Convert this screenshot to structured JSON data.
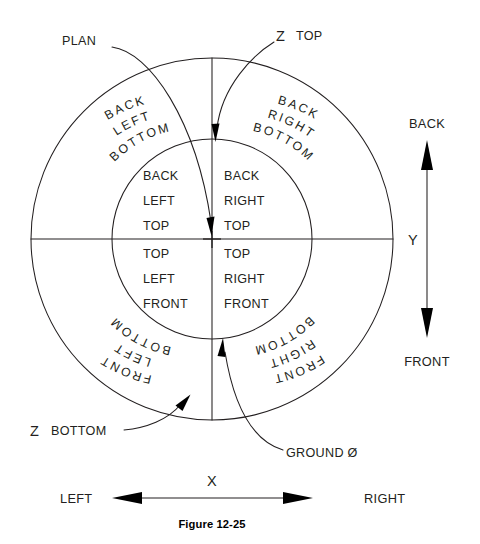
{
  "figure": {
    "caption": "Figure 12-25",
    "geometry": {
      "center_x": 212,
      "center_y": 239,
      "outer_radius": 181,
      "inner_radius": 100
    },
    "colors": {
      "line": "#231f20",
      "background": "#ffffff",
      "arrow_fill": "#000000"
    }
  },
  "callouts": [
    {
      "id": "plan",
      "label": "PLAN",
      "x": 62,
      "y": 45
    },
    {
      "id": "z-top",
      "label": "Z",
      "label2": "TOP",
      "x": 276,
      "y": 40
    },
    {
      "id": "z-bottom",
      "label": "Z",
      "label2": "BOTTOM",
      "x": 30,
      "y": 434
    },
    {
      "id": "ground-zero",
      "label": "GROUND Ø",
      "x": 286,
      "y": 452
    }
  ],
  "inner_quadrants": [
    {
      "id": "back-left-top",
      "position": "upper-left",
      "lines": [
        "BACK",
        "LEFT",
        "TOP"
      ]
    },
    {
      "id": "back-right-top",
      "position": "upper-right",
      "lines": [
        "BACK",
        "RIGHT",
        "TOP"
      ]
    },
    {
      "id": "top-left-front",
      "position": "lower-left",
      "lines": [
        "TOP",
        "LEFT",
        "FRONT"
      ]
    },
    {
      "id": "top-right-front",
      "position": "lower-right",
      "lines": [
        "TOP",
        "RIGHT",
        "FRONT"
      ]
    }
  ],
  "outer_quadrants": [
    {
      "id": "back-left-bottom",
      "position": "upper-left",
      "lines": [
        "BACK",
        "LEFT",
        "BOTTOM"
      ]
    },
    {
      "id": "back-right-bottom",
      "position": "upper-right",
      "lines": [
        "BACK",
        "RIGHT",
        "BOTTOM"
      ]
    },
    {
      "id": "bottom-left-front",
      "position": "lower-left",
      "lines": [
        "BOTTOM",
        "LEFT",
        "FRONT"
      ]
    },
    {
      "id": "bottom-right-front",
      "position": "lower-right",
      "lines": [
        "BOTTOM",
        "RIGHT",
        "FRONT"
      ]
    }
  ],
  "axes": {
    "y": {
      "letter": "Y",
      "positive_label": "BACK",
      "negative_label": "FRONT",
      "letter_x": 414,
      "letter_y": 244,
      "top_label_x": 427,
      "top_label_y": 124,
      "bottom_label_x": 427,
      "bottom_label_y": 362
    },
    "x": {
      "letter": "X",
      "negative_label": "LEFT",
      "positive_label": "RIGHT",
      "letter_x": 212,
      "letter_y": 483,
      "left_label_x": 60,
      "left_label_y": 503,
      "right_label_x": 364,
      "right_label_y": 503
    }
  }
}
